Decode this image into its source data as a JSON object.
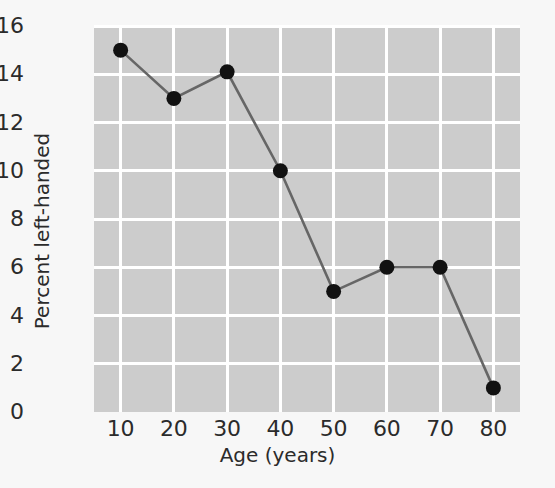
{
  "chart_data": {
    "type": "line",
    "title": "",
    "xlabel": "Age (years)",
    "ylabel": "Percent left-handed",
    "x": [
      10,
      20,
      30,
      40,
      50,
      60,
      70,
      80
    ],
    "values": [
      15,
      13,
      14.1,
      10,
      5,
      6,
      6,
      1
    ],
    "series": [
      {
        "name": "Percent left-handed",
        "values": [
          15,
          13,
          14.1,
          10,
          5,
          6,
          6,
          1
        ]
      }
    ],
    "xlim": [
      5,
      85
    ],
    "ylim": [
      0,
      16
    ],
    "xticks": [
      10,
      20,
      30,
      40,
      50,
      60,
      70,
      80
    ],
    "yticks": [
      0,
      2,
      4,
      6,
      8,
      10,
      12,
      14,
      16
    ],
    "xtick_labels": [
      "10",
      "20",
      "30",
      "40",
      "50",
      "60",
      "70",
      "80"
    ],
    "ytick_labels": [
      "0",
      "2",
      "4",
      "6",
      "8",
      "10",
      "12",
      "14",
      "16"
    ],
    "grid": true,
    "legend": false,
    "marker": "circle",
    "colors": {
      "panel_background": "#cccccc",
      "figure_background": "#f7f7f7",
      "grid": "#ffffff",
      "line": "#666666",
      "marker": "#111111",
      "text": "#2b2b2b"
    }
  }
}
